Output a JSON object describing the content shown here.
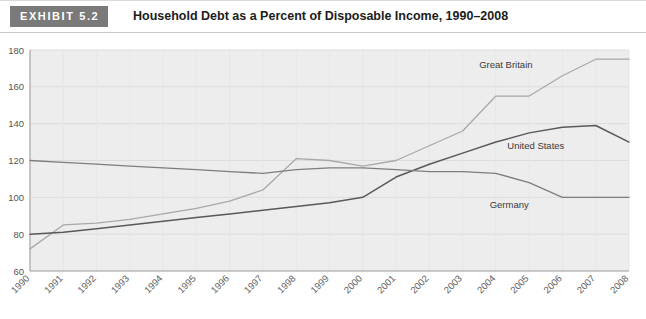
{
  "header": {
    "badge": "EXHIBIT 5.2",
    "title": "Household Debt as a Percent of Disposable Income, 1990–2008"
  },
  "colors": {
    "badge_bg": "#7a7a7a",
    "plot_bg": "#ededed",
    "gridline": "#dcdcdc",
    "axis": "#9a9a9a",
    "great_britain": "#a8a8a8",
    "united_states": "#595959",
    "germany": "#7d7d7d"
  },
  "chart_data": {
    "type": "line",
    "title": "Household Debt as a Percent of Disposable Income, 1990–2008",
    "xlabel": "",
    "ylabel": "",
    "grid": true,
    "legend": "inline-labels",
    "x": [
      1990,
      1991,
      1992,
      1993,
      1994,
      1995,
      1996,
      1997,
      1998,
      1999,
      2000,
      2001,
      2002,
      2003,
      2004,
      2005,
      2006,
      2007,
      2008
    ],
    "categories": [
      "1990",
      "1991",
      "1992",
      "1993",
      "1994",
      "1995",
      "1996",
      "1997",
      "1998",
      "1999",
      "2000",
      "2001",
      "2002",
      "2003",
      "2004",
      "2005",
      "2006",
      "2007",
      "2008"
    ],
    "xlim": [
      1990,
      2008
    ],
    "ylim": [
      60,
      180
    ],
    "yticks": [
      60,
      80,
      100,
      120,
      140,
      160,
      180
    ],
    "ytick_labels": [
      "60",
      "80",
      "100",
      "120",
      "140",
      "160",
      "180"
    ],
    "series": [
      {
        "name": "Great Britain",
        "color": "#a8a8a8",
        "label_x": 2004.3,
        "label_y": 170,
        "values": [
          72,
          85,
          86,
          88,
          91,
          94,
          98,
          104,
          121,
          120,
          117,
          120,
          128,
          136,
          155,
          155,
          166,
          175,
          175
        ]
      },
      {
        "name": "United States",
        "color": "#595959",
        "label_x": 2005.2,
        "label_y": 126,
        "values": [
          80,
          81,
          83,
          85,
          87,
          89,
          91,
          93,
          95,
          97,
          100,
          111,
          118,
          124,
          130,
          135,
          138,
          139,
          130
        ]
      },
      {
        "name": "Germany",
        "color": "#7d7d7d",
        "label_x": 2004.4,
        "label_y": 94,
        "values": [
          120,
          119,
          118,
          117,
          116,
          115,
          114,
          113,
          115,
          116,
          116,
          115,
          114,
          114,
          113,
          108,
          100,
          100,
          100
        ]
      }
    ]
  }
}
